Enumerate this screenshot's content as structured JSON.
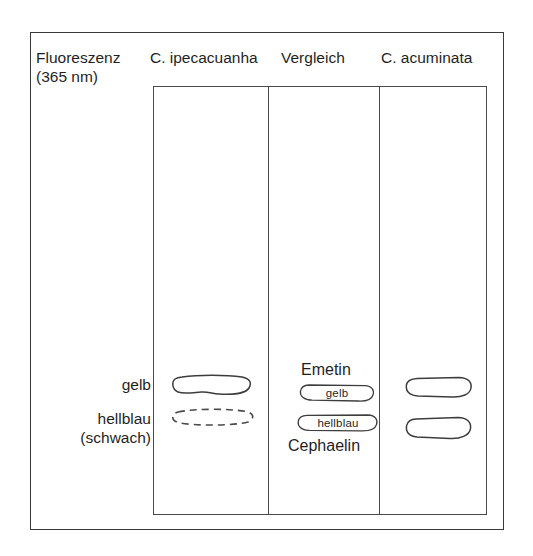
{
  "figure": {
    "type": "tlc-chromatogram-schematic",
    "header": {
      "fluorescence": {
        "line1": "Fluoreszenz",
        "line2": "(365 nm)"
      },
      "lanes": [
        {
          "label": "C. ipecacuanha"
        },
        {
          "label": "Vergleich"
        },
        {
          "label": "C. acuminata"
        }
      ]
    },
    "side_labels": {
      "upper": {
        "line1": "gelb"
      },
      "lower": {
        "line1": "hellblau",
        "line2": "(schwach)"
      }
    },
    "lanes": [
      {
        "name": "C. ipecacuanha",
        "bands": [
          {
            "label": "",
            "style": "solid",
            "position": "upper"
          },
          {
            "label": "",
            "style": "dashed",
            "position": "lower"
          }
        ]
      },
      {
        "name": "Vergleich",
        "compound_upper": "Emetin",
        "compound_lower": "Cephaelin",
        "bands": [
          {
            "label": "gelb",
            "style": "pill",
            "position": "upper"
          },
          {
            "label": "hellblau",
            "style": "pill",
            "position": "lower"
          }
        ]
      },
      {
        "name": "C. acuminata",
        "bands": [
          {
            "label": "",
            "style": "solid",
            "position": "upper"
          },
          {
            "label": "",
            "style": "solid",
            "position": "lower"
          }
        ]
      }
    ],
    "colors": {
      "background": "#ffffff",
      "frame": "#3a3a3a",
      "plate_border": "#4a4a4a",
      "band_stroke": "#3d3d3d",
      "text": "#1f1f1f"
    }
  }
}
